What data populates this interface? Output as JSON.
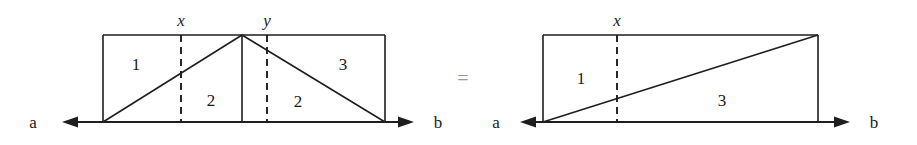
{
  "figure": {
    "caption_equals": "=",
    "left_diagram": {
      "name": "two-triangles-rectangle",
      "endpoint_left_label": "a",
      "endpoint_right_label": "b",
      "tick_labels": [
        "x",
        "y"
      ],
      "region_labels": [
        "1",
        "2",
        "2",
        "3"
      ],
      "rect": {
        "x": 103,
        "y": 35,
        "width": 282,
        "height": 87
      },
      "apex_x": 242,
      "dashed_x": [
        181,
        267
      ],
      "axis_y": 122,
      "axis_from": 62,
      "axis_to": 414
    },
    "right_diagram": {
      "name": "single-triangle-rectangle",
      "endpoint_left_label": "a",
      "endpoint_right_label": "b",
      "tick_labels": [
        "x"
      ],
      "region_labels": [
        "1",
        "3"
      ],
      "rect": {
        "x": 543,
        "y": 35,
        "width": 275,
        "height": 87
      },
      "dashed_x": [
        617
      ],
      "axis_y": 122,
      "axis_from": 520,
      "axis_to": 850
    },
    "colors": {
      "line": "#1e1e1e",
      "text": "#1a1a1a",
      "equals": "#9a9a9a",
      "background": "#ffffff"
    }
  }
}
